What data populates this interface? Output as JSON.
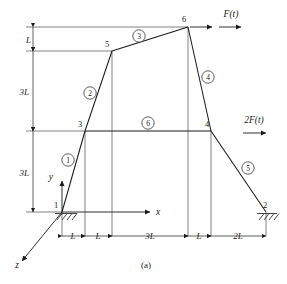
{
  "figure": {
    "caption": "(a)",
    "type": "structural-frame-diagram",
    "nodes": [
      {
        "id": "1",
        "label": "1",
        "x": 62,
        "y": 212,
        "support": "fixed-hatched"
      },
      {
        "id": "2",
        "label": "2",
        "x": 266,
        "y": 212,
        "support": "fixed-hatched"
      },
      {
        "id": "3",
        "label": "3",
        "x": 85,
        "y": 131,
        "support": "none"
      },
      {
        "id": "4",
        "label": "4",
        "x": 211,
        "y": 131,
        "support": "none"
      },
      {
        "id": "5",
        "label": "5",
        "x": 112,
        "y": 51,
        "support": "none"
      },
      {
        "id": "6",
        "label": "6",
        "x": 188,
        "y": 27,
        "support": "none"
      }
    ],
    "elements": [
      {
        "id": "1",
        "label": "1",
        "from": "1",
        "to": "3",
        "tag_x": 68,
        "tag_y": 160
      },
      {
        "id": "2",
        "label": "2",
        "from": "3",
        "to": "5",
        "tag_x": 90,
        "tag_y": 93
      },
      {
        "id": "3",
        "label": "3",
        "from": "5",
        "to": "6",
        "tag_x": 139,
        "tag_y": 36
      },
      {
        "id": "4",
        "label": "4",
        "from": "6",
        "to": "4",
        "tag_x": 208,
        "tag_y": 77
      },
      {
        "id": "5",
        "label": "5",
        "from": "4",
        "to": "2",
        "tag_x": 248,
        "tag_y": 168
      },
      {
        "id": "6",
        "label": "6",
        "from": "3",
        "to": "4",
        "tag_x": 148,
        "tag_y": 123
      }
    ],
    "forces": [
      {
        "label": "F(t)",
        "at_node": "6",
        "direction": "right",
        "tag_x": 231,
        "tag_y": 16
      },
      {
        "label": "2F(t)",
        "at_node": "4",
        "direction": "right",
        "tag_x": 250,
        "tag_y": 122
      }
    ],
    "axes": [
      {
        "label": "x",
        "direction": "right",
        "tag_x": 154,
        "tag_y": 215
      },
      {
        "label": "y",
        "direction": "up",
        "tag_x": 52,
        "tag_y": 176
      },
      {
        "label": "z",
        "direction": "down-left",
        "tag_x": 18,
        "tag_y": 266
      }
    ],
    "horizontal_dimensions": [
      {
        "label": "L",
        "from_x": 62,
        "to_x": 85,
        "tag_x": 73,
        "tag_y": 240
      },
      {
        "label": "L",
        "from_x": 85,
        "to_x": 112,
        "tag_x": 98,
        "tag_y": 240
      },
      {
        "label": "3L",
        "from_x": 112,
        "to_x": 188,
        "tag_x": 150,
        "tag_y": 240
      },
      {
        "label": "L",
        "from_x": 188,
        "to_x": 211,
        "tag_x": 199,
        "tag_y": 240
      },
      {
        "label": "2L",
        "from_x": 211,
        "to_x": 266,
        "tag_x": 238,
        "tag_y": 240
      }
    ],
    "vertical_dimensions": [
      {
        "label": "L",
        "from_y": 27,
        "to_y": 51,
        "tag_x": 33,
        "tag_y": 44
      },
      {
        "label": "3L",
        "from_y": 51,
        "to_y": 131,
        "tag_x": 24,
        "tag_y": 95
      },
      {
        "label": "3L",
        "from_y": 131,
        "to_y": 212,
        "tag_x": 24,
        "tag_y": 176
      }
    ]
  },
  "colors": {
    "line": "#1a1a1a",
    "guide": "#4a4a4a",
    "background": "#ffffff"
  }
}
